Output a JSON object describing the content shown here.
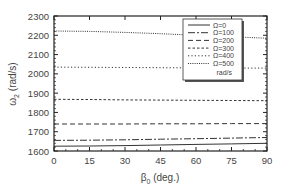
{
  "chart_data": {
    "type": "line",
    "title": "",
    "xlabel": "β0 (deg.)",
    "xlabel_main": "β",
    "xlabel_sub": "0",
    "xlabel_unit": " (deg.)",
    "ylabel": "ω2 (rad/s)",
    "ylabel_main": "ω",
    "ylabel_sub": "2",
    "ylabel_unit": " (rad/s)",
    "xlim": [
      0,
      90
    ],
    "ylim": [
      1600,
      2300
    ],
    "xticks": [
      0,
      15,
      30,
      45,
      60,
      75,
      90
    ],
    "yticks": [
      1600,
      1700,
      1800,
      1900,
      2000,
      2100,
      2200,
      2300
    ],
    "grid": false,
    "legend_position": "upper right (inside)",
    "legend_units": "rad/s",
    "x": [
      0,
      15,
      30,
      45,
      60,
      75,
      90
    ],
    "series": [
      {
        "name": "Ω=0",
        "style": "solid",
        "values": [
          1625,
          1626,
          1628,
          1631,
          1634,
          1637,
          1640
        ]
      },
      {
        "name": "Ω=100",
        "style": "dashdot",
        "values": [
          1655,
          1656,
          1658,
          1661,
          1664,
          1667,
          1670
        ]
      },
      {
        "name": "Ω=200",
        "style": "dashed",
        "values": [
          1740,
          1740,
          1740,
          1741,
          1741,
          1742,
          1742
        ]
      },
      {
        "name": "Ω=300",
        "style": "shortdash",
        "values": [
          1868,
          1867,
          1865,
          1864,
          1863,
          1862,
          1861
        ]
      },
      {
        "name": "Ω=400",
        "style": "dotted",
        "values": [
          2035,
          2034,
          2033,
          2032,
          2031,
          2030,
          2030
        ]
      },
      {
        "name": "Ω=500",
        "style": "densedot",
        "values": [
          2222,
          2220,
          2215,
          2208,
          2200,
          2192,
          2185
        ]
      }
    ]
  }
}
